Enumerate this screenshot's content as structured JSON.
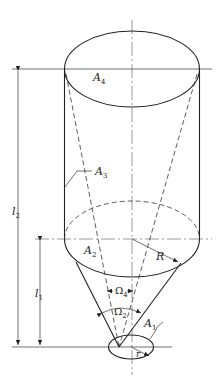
{
  "diagram": {
    "type": "geometric-view-factor-figure",
    "labels": {
      "a4": {
        "base": "A",
        "sub": "4"
      },
      "a3": {
        "base": "A",
        "sub": "3"
      },
      "a2": {
        "base": "A",
        "sub": "2"
      },
      "a1": {
        "base": "A",
        "sub": "1"
      },
      "omega4": {
        "base": "Ω",
        "sub": "4"
      },
      "omega2": {
        "base": "Ω",
        "sub": "2"
      },
      "l2": {
        "base": "l",
        "sub": "2"
      },
      "l1": {
        "base": "l",
        "sub": "1"
      },
      "R": "R",
      "r": "r"
    },
    "colors": {
      "stroke": "#222222",
      "background": "#ffffff"
    }
  }
}
